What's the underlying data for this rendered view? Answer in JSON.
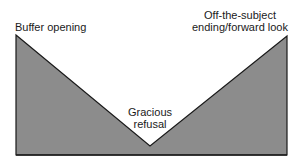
{
  "diagram": {
    "type": "v-shaped-structure",
    "fill_color": "#8c8c8c",
    "stroke_color": "#1a1a1a",
    "labels": {
      "left": "Buffer opening",
      "center": [
        "Gracious",
        "refusal"
      ],
      "right": [
        "Off-the-subject",
        "ending/forward look"
      ]
    }
  }
}
